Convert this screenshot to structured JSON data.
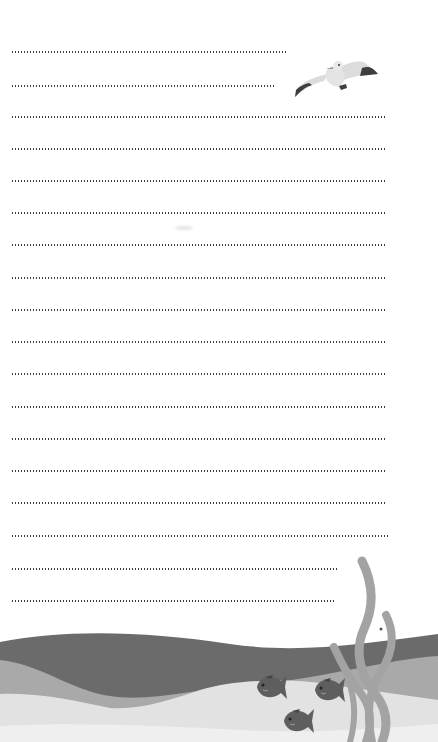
{
  "page": {
    "type": "lined-notepaper",
    "background": "#ffffff",
    "dot_color": "#3a3a3a"
  },
  "lines": [
    {
      "y": 52,
      "end_x": 288
    },
    {
      "y": 86,
      "end_x": 274
    },
    {
      "y": 117,
      "end_x": 386
    },
    {
      "y": 149,
      "end_x": 386
    },
    {
      "y": 181,
      "end_x": 386
    },
    {
      "y": 213,
      "end_x": 386
    },
    {
      "y": 245,
      "end_x": 386
    },
    {
      "y": 278,
      "end_x": 386
    },
    {
      "y": 310,
      "end_x": 386
    },
    {
      "y": 342,
      "end_x": 386
    },
    {
      "y": 374,
      "end_x": 386
    },
    {
      "y": 407,
      "end_x": 386
    },
    {
      "y": 439,
      "end_x": 386
    },
    {
      "y": 471,
      "end_x": 386
    },
    {
      "y": 503,
      "end_x": 386
    },
    {
      "y": 536,
      "end_x": 390
    },
    {
      "y": 569,
      "end_x": 338
    },
    {
      "y": 601,
      "end_x": 335
    }
  ],
  "illustrations": {
    "bird": {
      "name": "seagull-icon",
      "x": 294,
      "y": 53,
      "width": 80,
      "height": 44
    },
    "waves": {
      "dark": "#6b6b6b",
      "mid": "#a9a9a9",
      "light": "#e2e2e2",
      "lightest": "#f1f1f1"
    },
    "seaweed_color": "#a3a3a3",
    "fish_color": "#5e5e5e",
    "fish_count": 3
  }
}
